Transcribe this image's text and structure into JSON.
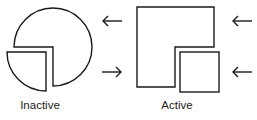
{
  "diagram": {
    "stroke_color": "#1a1a1a",
    "background": "#ffffff",
    "panels": [
      {
        "id": "inactive",
        "label": "Inactive",
        "shape": "circle",
        "large_piece": "circle-with-quarter-notch",
        "small_piece": "quarter-circle",
        "arrows": [
          {
            "position": "top",
            "direction": "left",
            "glyph": "←"
          },
          {
            "position": "bottom",
            "direction": "right",
            "glyph": "→"
          }
        ]
      },
      {
        "id": "active",
        "label": "Active",
        "shape": "square",
        "large_piece": "square-with-quarter-notch",
        "small_piece": "square",
        "arrows": [
          {
            "position": "top",
            "direction": "left",
            "glyph": "←"
          },
          {
            "position": "bottom",
            "direction": "left",
            "glyph": "←"
          }
        ]
      }
    ]
  }
}
